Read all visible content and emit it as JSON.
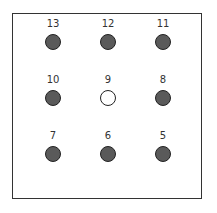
{
  "diagram": {
    "nodes": [
      {
        "label": "13",
        "filled": true,
        "row": 0,
        "col": 0
      },
      {
        "label": "12",
        "filled": true,
        "row": 0,
        "col": 1
      },
      {
        "label": "11",
        "filled": true,
        "row": 0,
        "col": 2
      },
      {
        "label": "10",
        "filled": true,
        "row": 1,
        "col": 0
      },
      {
        "label": "9",
        "filled": false,
        "row": 1,
        "col": 1
      },
      {
        "label": "8",
        "filled": true,
        "row": 1,
        "col": 2
      },
      {
        "label": "7",
        "filled": true,
        "row": 2,
        "col": 0
      },
      {
        "label": "6",
        "filled": true,
        "row": 2,
        "col": 1
      },
      {
        "label": "5",
        "filled": true,
        "row": 2,
        "col": 2
      }
    ],
    "colors": {
      "filled": "#5a5a5a",
      "empty": "#ffffff",
      "border": "#222222"
    }
  }
}
